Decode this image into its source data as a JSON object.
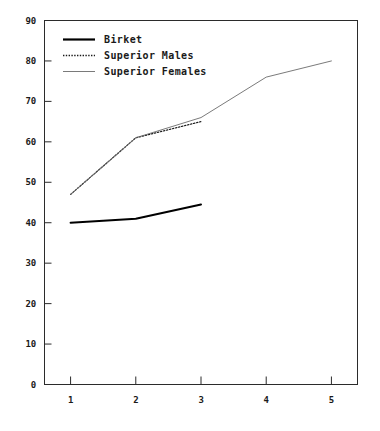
{
  "chart_data": {
    "type": "line",
    "title": "",
    "subtitle": "",
    "xlabel": "",
    "ylabel": "",
    "xlim": [
      0.6,
      5.4
    ],
    "ylim": [
      0,
      90
    ],
    "x_ticks": [
      "1",
      "2",
      "3",
      "4",
      "5"
    ],
    "y_ticks": [
      "0",
      "10",
      "20",
      "30",
      "40",
      "50",
      "60",
      "70",
      "80",
      "90"
    ],
    "x": [
      1,
      2,
      3,
      4,
      5
    ],
    "grid": false,
    "legend_position": "top-left",
    "frame": "box",
    "series": [
      {
        "name": "Birket",
        "style": "solid",
        "color": "#000000",
        "width": 2.0,
        "x": [
          1,
          2,
          3
        ],
        "values": [
          40,
          41,
          44.5
        ]
      },
      {
        "name": "Superior Males",
        "style": "dotted",
        "color": "#1a1a1a",
        "width": 1.2,
        "x": [
          1,
          2,
          3
        ],
        "values": [
          47,
          61,
          65
        ]
      },
      {
        "name": "Superior Females",
        "style": "thin",
        "color": "#6b6b6b",
        "width": 0.9,
        "x": [
          1,
          2,
          3,
          4,
          5
        ],
        "values": [
          47,
          61,
          66,
          76,
          80
        ]
      }
    ]
  },
  "legend": {
    "items": [
      {
        "label": "Birket"
      },
      {
        "label": "Superior Males"
      },
      {
        "label": "Superior Females"
      }
    ]
  },
  "axes": {
    "y_ticks": [
      "90",
      "80",
      "70",
      "60",
      "50",
      "40",
      "30",
      "20",
      "10",
      "0"
    ],
    "x_ticks": [
      "1",
      "2",
      "3",
      "4",
      "5"
    ]
  }
}
